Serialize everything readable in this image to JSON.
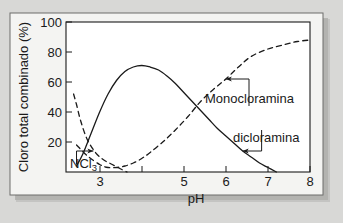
{
  "chart_data": {
    "type": "line",
    "title": "",
    "xlabel": "pH",
    "ylabel": "Cloro total combinado (%)",
    "xlim": [
      2.2,
      8.0
    ],
    "ylim": [
      0,
      100
    ],
    "grid": false,
    "legend_position": "inline-annotations",
    "xticks": [
      3,
      5,
      6,
      7,
      8
    ],
    "xtick_labels": [
      "3",
      "5",
      "6",
      "7",
      "8"
    ],
    "yticks": [
      20,
      40,
      60,
      80,
      100
    ],
    "ytick_labels": [
      "20",
      "40",
      "60",
      "80",
      "100"
    ],
    "series": [
      {
        "name": "dicloramina",
        "style": "solid",
        "color": "#1a1a1a",
        "x": [
          2.45,
          2.6,
          2.8,
          3.0,
          3.2,
          3.4,
          3.6,
          3.8,
          4.0,
          4.2,
          4.4,
          4.6,
          4.8,
          5.0,
          5.2,
          5.4,
          5.6,
          5.8,
          6.0,
          6.2,
          6.4,
          6.6,
          6.8,
          7.0,
          7.2
        ],
        "y": [
          4,
          12,
          26,
          40,
          52,
          61,
          67,
          70,
          71,
          70,
          68,
          64,
          59,
          53,
          47,
          41,
          35,
          29,
          24,
          19,
          14,
          10,
          6,
          3,
          0
        ]
      },
      {
        "name": "monocloramina",
        "style": "dashed",
        "color": "#1a1a1a",
        "x": [
          2.45,
          2.7,
          3.0,
          3.2,
          3.4,
          3.6,
          3.8,
          4.0,
          4.2,
          4.5,
          4.8,
          5.1,
          5.4,
          5.7,
          6.0,
          6.3,
          6.6,
          7.0,
          7.4,
          7.7,
          8.0
        ],
        "y": [
          18,
          11,
          5,
          3,
          3,
          4,
          6,
          9,
          13,
          20,
          28,
          37,
          47,
          55,
          62,
          70,
          77,
          82,
          85,
          87,
          88
        ]
      },
      {
        "name": "NCl3",
        "style": "dashed",
        "color": "#1a1a1a",
        "x": [
          2.38,
          2.45,
          2.55,
          2.7,
          2.9,
          3.1,
          3.3,
          3.5,
          3.65
        ],
        "y": [
          52,
          45,
          34,
          22,
          13,
          8,
          5,
          2,
          0
        ]
      }
    ],
    "annotations": [
      {
        "name": "monocloramina",
        "label": "Monocloramina",
        "target_x": 6.0,
        "target_y": 62,
        "label_x": 6.55,
        "label_y": 44
      },
      {
        "name": "dicloramina",
        "label": "dicloramina",
        "target_x": 6.4,
        "target_y": 14,
        "label_x": 6.85,
        "label_y": 28
      },
      {
        "name": "NCl3",
        "label_html": "NCl<sub>3</sub>",
        "label": "NCl3",
        "target_x": 2.85,
        "target_y": 14,
        "label_x": 2.45,
        "label_y": 5
      }
    ]
  },
  "figure": {
    "panel_background": "#ffffff",
    "page_background": "#d8d8d6",
    "axis_color": "#1a1a1a",
    "text_color": "#1a1a1a"
  }
}
